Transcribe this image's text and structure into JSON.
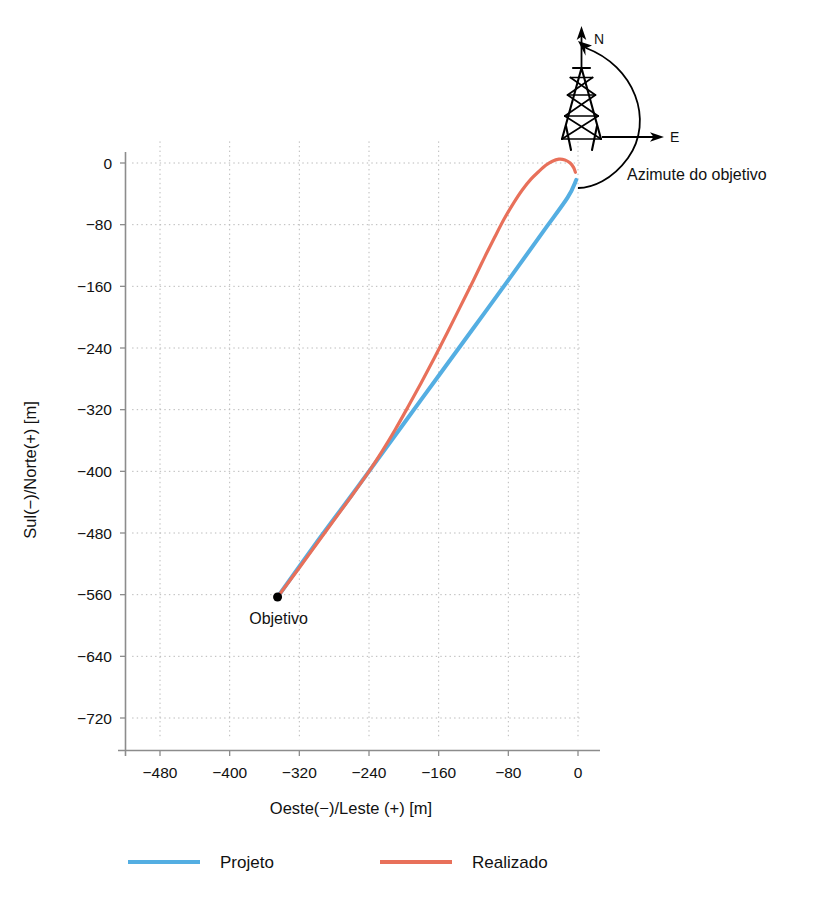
{
  "chart_data": {
    "type": "line",
    "title": "",
    "subtitle": "",
    "xlabel": "Oeste(−)/Leste (+) [m]",
    "ylabel": "Sul(−)/Norte(+) [m]",
    "xlim": [
      -512,
      8
    ],
    "ylim": [
      -752,
      28
    ],
    "xticks": [
      -480,
      -400,
      -320,
      -240,
      -160,
      -80,
      0
    ],
    "xticklabels": [
      "−480",
      "−400",
      "−320",
      "−240",
      "−160",
      "−80",
      "0"
    ],
    "yticks": [
      0,
      -80,
      -160,
      -240,
      -320,
      -400,
      -480,
      -560,
      -640,
      -720
    ],
    "yticklabels": [
      "0",
      "−80",
      "−160",
      "−240",
      "−320",
      "−400",
      "−480",
      "−560",
      "−640",
      "−720"
    ],
    "grid": true,
    "grid_style": "dotted",
    "legend_position": "bottom",
    "series": [
      {
        "name": "Projeto",
        "color": "#54AEE2",
        "linewidth": 4,
        "points": [
          [
            -345,
            -563
          ],
          [
            -300,
            -492
          ],
          [
            -260,
            -431
          ],
          [
            -240,
            -400
          ],
          [
            -200,
            -338
          ],
          [
            -160,
            -276
          ],
          [
            -120,
            -214
          ],
          [
            -80,
            -152
          ],
          [
            -40,
            -89
          ],
          [
            -12,
            -45
          ],
          [
            -2,
            -22
          ]
        ]
      },
      {
        "name": "Realizado",
        "color": "#E8705A",
        "linewidth": 3.2,
        "points": [
          [
            -345,
            -563
          ],
          [
            -320,
            -525
          ],
          [
            -300,
            -494
          ],
          [
            -280,
            -463
          ],
          [
            -260,
            -432
          ],
          [
            -240,
            -400
          ],
          [
            -225,
            -374
          ],
          [
            -210,
            -346
          ],
          [
            -195,
            -316
          ],
          [
            -180,
            -285
          ],
          [
            -165,
            -253
          ],
          [
            -150,
            -220
          ],
          [
            -135,
            -186
          ],
          [
            -120,
            -152
          ],
          [
            -108,
            -124
          ],
          [
            -96,
            -97
          ],
          [
            -85,
            -73
          ],
          [
            -74,
            -52
          ],
          [
            -64,
            -35
          ],
          [
            -54,
            -21
          ],
          [
            -45,
            -11
          ],
          [
            -37,
            -3
          ],
          [
            -30,
            2
          ],
          [
            -22,
            5
          ],
          [
            -15,
            4
          ],
          [
            -9,
            0
          ],
          [
            -5,
            -6
          ],
          [
            -3,
            -12
          ]
        ]
      }
    ],
    "markers": [
      {
        "name": "Objetivo",
        "label": "Objetivo",
        "x": -345,
        "y": -563,
        "color": "#000000",
        "size": 9
      }
    ],
    "annotations": [
      {
        "name": "azimuth-label",
        "text": "Azimute do objetivo"
      },
      {
        "name": "north-label",
        "text": "N"
      },
      {
        "name": "east-label",
        "text": "E"
      }
    ]
  },
  "legend": {
    "items": [
      {
        "label": "Projeto",
        "color": "#54AEE2"
      },
      {
        "label": "Realizado",
        "color": "#E8705A"
      }
    ]
  },
  "axes": {
    "xlabel": "Oeste(−)/Leste (+) [m]",
    "ylabel": "Sul(−)/Norte(+) [m]"
  },
  "rig": {
    "north_label": "N",
    "east_label": "E",
    "azimuth_label": "Azimute do objetivo",
    "icon": "drilling-derrick-icon"
  },
  "target": {
    "label": "Objetivo"
  },
  "ticks": {
    "x": [
      "−480",
      "−400",
      "−320",
      "−240",
      "−160",
      "−80",
      "0"
    ],
    "y": [
      "0",
      "−80",
      "−160",
      "−240",
      "−320",
      "−400",
      "−480",
      "−560",
      "−640",
      "−720"
    ]
  },
  "colors": {
    "projeto": "#54AEE2",
    "realizado": "#E8705A",
    "grid": "#b9b9b9",
    "axis": "#8c8c8c",
    "text": "#111111"
  }
}
